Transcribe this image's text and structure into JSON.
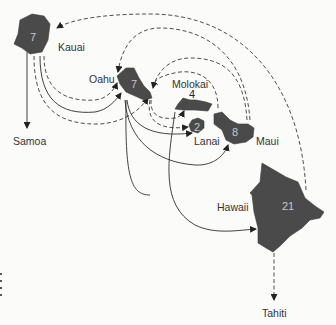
{
  "diagram": {
    "type": "migration-map",
    "islands": [
      {
        "name": "Kauai",
        "value": "7"
      },
      {
        "name": "Oahu",
        "value": "7"
      },
      {
        "name": "Molokai",
        "value": "4"
      },
      {
        "name": "Lanai",
        "value": "2"
      },
      {
        "name": "Maui",
        "value": "8"
      },
      {
        "name": "Hawaii",
        "value": "21"
      }
    ],
    "destinations": [
      {
        "name": "Samoa",
        "line_style": "solid"
      },
      {
        "name": "Tahiti",
        "line_style": "dashed"
      }
    ],
    "legend_hint": {
      "solid": "solid arrow",
      "dashed": "dashed arrow"
    },
    "colors": {
      "island_fill": "#4a4a4a",
      "line": "#2e2e2e",
      "background": "#fbfbfa"
    }
  }
}
